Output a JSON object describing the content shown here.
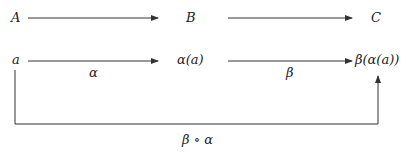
{
  "diagram": {
    "nodes": {
      "A": "A",
      "B": "B",
      "C": "C",
      "a": "a",
      "alpha_a": "α(a)",
      "beta_alpha_a": "β(α(a))"
    },
    "edge_labels": {
      "alpha": "α",
      "beta": "β",
      "composition": "β ∘ α"
    },
    "edges": [
      {
        "from": "A",
        "to": "B",
        "label": ""
      },
      {
        "from": "B",
        "to": "C",
        "label": ""
      },
      {
        "from": "a",
        "to": "α(a)",
        "label": "α"
      },
      {
        "from": "α(a)",
        "to": "β(α(a))",
        "label": "β"
      },
      {
        "from": "a",
        "to": "β(α(a))",
        "label": "β ∘ α",
        "routed": "below"
      }
    ],
    "colors": {
      "line": "#333333",
      "text": "#222222",
      "background": "#ffffff"
    }
  }
}
